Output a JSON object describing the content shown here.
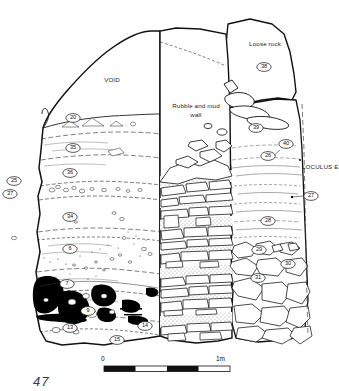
{
  "figure": {
    "number": "47",
    "type": "archaeological-section-drawing"
  },
  "annotations": {
    "void": "VOID",
    "wall_line1": "Rubble and mud",
    "wall_line2": "wall",
    "loose_rock": "Loose rock",
    "loculus": "LOCULUS E"
  },
  "scale_bar": {
    "start_label": "0",
    "end_label": "1m",
    "segments": 4
  },
  "context_labels": [
    {
      "id": "20",
      "x": 73,
      "y": 118
    },
    {
      "id": "35",
      "x": 73,
      "y": 148
    },
    {
      "id": "36",
      "x": 70,
      "y": 173
    },
    {
      "id": "25",
      "x": 14,
      "y": 181
    },
    {
      "id": "37",
      "x": 10,
      "y": 194
    },
    {
      "id": "34",
      "x": 70,
      "y": 217
    },
    {
      "id": "6",
      "x": 70,
      "y": 249
    },
    {
      "id": "7",
      "x": 67,
      "y": 284
    },
    {
      "id": "9",
      "x": 88,
      "y": 311
    },
    {
      "id": "13",
      "x": 70,
      "y": 328
    },
    {
      "id": "14",
      "x": 145,
      "y": 326
    },
    {
      "id": "15",
      "x": 117,
      "y": 340
    },
    {
      "id": "38",
      "x": 264,
      "y": 67
    },
    {
      "id": "39",
      "x": 256,
      "y": 128
    },
    {
      "id": "40",
      "x": 286,
      "y": 144
    },
    {
      "id": "26",
      "x": 268,
      "y": 156
    },
    {
      "id": "27",
      "x": 311,
      "y": 196
    },
    {
      "id": "28",
      "x": 268,
      "y": 221
    },
    {
      "id": "29",
      "x": 259,
      "y": 250
    },
    {
      "id": "30",
      "x": 288,
      "y": 264
    },
    {
      "id": "31",
      "x": 258,
      "y": 278
    }
  ],
  "colors": {
    "ink": "#111111",
    "fill": "#ffffff",
    "stipple": "#9a9a9a",
    "charcoal": "#000000"
  }
}
